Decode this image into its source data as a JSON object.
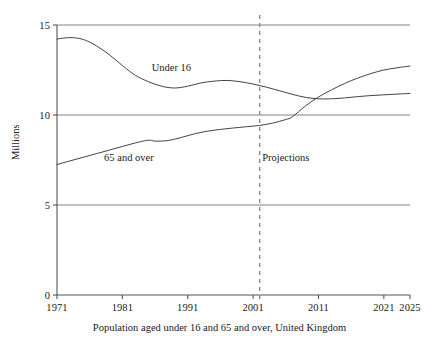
{
  "chart_data": {
    "type": "line",
    "title": "",
    "caption": "Population aged under 16 and 65 and over, United Kingdom",
    "xlabel": "",
    "ylabel": "Millions",
    "xlim": [
      1971,
      2025
    ],
    "ylim": [
      0,
      15
    ],
    "xticks": [
      1971,
      1981,
      1991,
      2001,
      2011,
      2021,
      2025
    ],
    "xtick_labels": [
      "1971",
      "1981",
      "1991",
      "2001",
      "2011",
      "2021",
      "2025"
    ],
    "yticks": [
      0,
      5,
      10,
      15
    ],
    "ytick_labels": [
      "0",
      "5",
      "10",
      "15"
    ],
    "grid": "horizontal gridlines at 5, 10, 15",
    "legend_position": "inline annotations on curves",
    "line_color": "#444444",
    "gridline_color": "#777777",
    "axis_color": "#555555",
    "annotations": [
      {
        "name": "under-16-label",
        "text": "Under 16",
        "x": 1988.5,
        "y": 12.55
      },
      {
        "name": "65-and-over-label",
        "text": "65 and over",
        "x": 1982.0,
        "y": 7.55
      },
      {
        "name": "projections-label",
        "text": "Projections",
        "x": 2006.0,
        "y": 7.55
      }
    ],
    "projection_divider": {
      "name": "projections-divider",
      "x": 2002,
      "style": "dashed",
      "color": "#8a8a8a"
    },
    "series": [
      {
        "name": "Under 16",
        "values": [
          {
            "x": 1971,
            "y": 14.22
          },
          {
            "x": 1973,
            "y": 14.3
          },
          {
            "x": 1975,
            "y": 14.2
          },
          {
            "x": 1977,
            "y": 13.85
          },
          {
            "x": 1979,
            "y": 13.35
          },
          {
            "x": 1981,
            "y": 12.75
          },
          {
            "x": 1983,
            "y": 12.2
          },
          {
            "x": 1985,
            "y": 11.85
          },
          {
            "x": 1987,
            "y": 11.6
          },
          {
            "x": 1989,
            "y": 11.5
          },
          {
            "x": 1991,
            "y": 11.6
          },
          {
            "x": 1993,
            "y": 11.78
          },
          {
            "x": 1995,
            "y": 11.88
          },
          {
            "x": 1997,
            "y": 11.92
          },
          {
            "x": 1999,
            "y": 11.85
          },
          {
            "x": 2001,
            "y": 11.72
          },
          {
            "x": 2003,
            "y": 11.55
          },
          {
            "x": 2005,
            "y": 11.35
          },
          {
            "x": 2007,
            "y": 11.15
          },
          {
            "x": 2009,
            "y": 10.98
          },
          {
            "x": 2011,
            "y": 10.9
          },
          {
            "x": 2013,
            "y": 10.9
          },
          {
            "x": 2015,
            "y": 10.95
          },
          {
            "x": 2017,
            "y": 11.02
          },
          {
            "x": 2019,
            "y": 11.08
          },
          {
            "x": 2021,
            "y": 11.12
          },
          {
            "x": 2023,
            "y": 11.16
          },
          {
            "x": 2025,
            "y": 11.2
          }
        ]
      },
      {
        "name": "65 and over",
        "values": [
          {
            "x": 1971,
            "y": 7.25
          },
          {
            "x": 1973,
            "y": 7.45
          },
          {
            "x": 1975,
            "y": 7.65
          },
          {
            "x": 1977,
            "y": 7.85
          },
          {
            "x": 1979,
            "y": 8.05
          },
          {
            "x": 1981,
            "y": 8.25
          },
          {
            "x": 1983,
            "y": 8.45
          },
          {
            "x": 1985,
            "y": 8.6
          },
          {
            "x": 1986,
            "y": 8.55
          },
          {
            "x": 1988,
            "y": 8.58
          },
          {
            "x": 1990,
            "y": 8.75
          },
          {
            "x": 1992,
            "y": 8.95
          },
          {
            "x": 1994,
            "y": 9.1
          },
          {
            "x": 1996,
            "y": 9.2
          },
          {
            "x": 1998,
            "y": 9.28
          },
          {
            "x": 2000,
            "y": 9.35
          },
          {
            "x": 2002,
            "y": 9.42
          },
          {
            "x": 2004,
            "y": 9.55
          },
          {
            "x": 2006,
            "y": 9.75
          },
          {
            "x": 2007,
            "y": 9.9
          },
          {
            "x": 2009,
            "y": 10.5
          },
          {
            "x": 2011,
            "y": 11.0
          },
          {
            "x": 2013,
            "y": 11.4
          },
          {
            "x": 2015,
            "y": 11.75
          },
          {
            "x": 2017,
            "y": 12.05
          },
          {
            "x": 2019,
            "y": 12.3
          },
          {
            "x": 2021,
            "y": 12.5
          },
          {
            "x": 2023,
            "y": 12.62
          },
          {
            "x": 2025,
            "y": 12.72
          }
        ]
      }
    ]
  }
}
